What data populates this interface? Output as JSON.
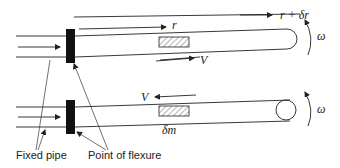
{
  "diagram": {
    "top": {
      "labels": {
        "outer_radius": "r + δr",
        "inner_radius": "r",
        "velocity": "V",
        "angular_velocity": "ω"
      }
    },
    "bottom": {
      "labels": {
        "velocity": "V",
        "mass_element": "δm",
        "angular_velocity": "ω"
      }
    },
    "callouts": {
      "fixed_pipe": "Fixed pipe",
      "point_of_flexure": "Point of flexure"
    },
    "colors": {
      "ink": "#222222",
      "background": "#ffffff"
    }
  }
}
